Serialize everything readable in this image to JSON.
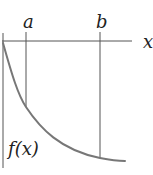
{
  "diagram": {
    "axis_label_x": "x",
    "curve_label": "f(x)",
    "markers": [
      {
        "label": "a"
      },
      {
        "label": "b"
      }
    ],
    "colors": {
      "axes": "#555555",
      "curve": "#777777",
      "text": "#222222",
      "background": "#ffffff"
    }
  }
}
